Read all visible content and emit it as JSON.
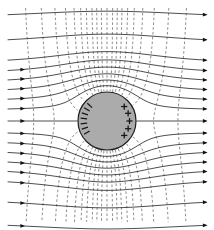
{
  "figure": {
    "width": 214,
    "height": 230,
    "background_color": "#ffffff"
  },
  "sphere": {
    "label": "conducting-sphere",
    "center_x": 107,
    "center_y": 121,
    "radius": 29,
    "fill_color": "#ababab",
    "outline_color": "#1e1e1e"
  },
  "field_lines": {
    "label": "electric-field-lines",
    "style": "solid",
    "color": "#3a3a3a",
    "direction": "left-to-right",
    "count": 17,
    "y_positions": [
      19,
      44,
      64,
      74,
      83,
      92,
      101,
      110,
      121,
      132,
      141,
      150,
      159,
      168,
      178,
      198,
      221
    ],
    "arrow_color": "#111111",
    "arrow_left_rows": [
      3,
      4,
      5,
      6,
      7,
      8,
      9,
      10,
      11,
      12,
      13,
      14,
      15,
      16
    ],
    "arrow_right_rows": [
      0,
      1,
      2,
      3,
      4,
      5,
      6,
      7,
      8,
      9,
      10,
      11,
      12,
      13,
      14,
      15,
      16
    ]
  },
  "equipotentials": {
    "label": "equipotential-lines",
    "style": "dashed",
    "color": "#7a7a7a",
    "count": 19,
    "x_positions": [
      22,
      38,
      52,
      63,
      72,
      79,
      85,
      91,
      96,
      101,
      107,
      113,
      118,
      123,
      129,
      136,
      145,
      157,
      172,
      190
    ]
  },
  "charges": {
    "negative": {
      "label": "induced-negative-charge",
      "symbol": "minus",
      "count": 7,
      "side": "left",
      "angles_deg": [
        150,
        162,
        174,
        186,
        198,
        210,
        222
      ]
    },
    "positive": {
      "label": "induced-positive-charge",
      "symbol": "plus",
      "count": 5,
      "side": "right",
      "angles_deg": [
        -40,
        -20,
        0,
        20,
        40
      ]
    }
  },
  "chart_data": {
    "type": "line",
    "xlabel": "",
    "ylabel": "",
    "series": [
      {
        "name": "Electric field lines (solid, arrowed)",
        "values": [
          19,
          44,
          64,
          74,
          83,
          92,
          101,
          110,
          121,
          132,
          141,
          150,
          159,
          168,
          178,
          198,
          221
        ]
      },
      {
        "name": "Equipotential lines (dashed)",
        "values": [
          22,
          38,
          52,
          63,
          72,
          79,
          85,
          91,
          96,
          101,
          107,
          113,
          118,
          123,
          129,
          136,
          145,
          157,
          172,
          190
        ]
      }
    ]
  }
}
